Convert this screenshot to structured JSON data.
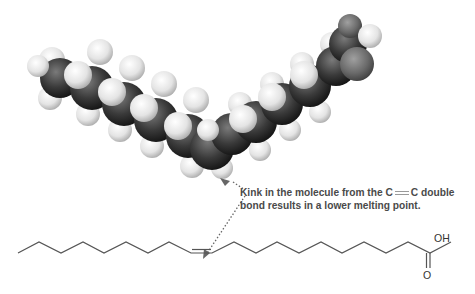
{
  "figure": {
    "type": "fatty acid molecule diagram",
    "space_filling_model": {
      "description": "Space-filling model of an unsaturated (cis) fatty acid showing a kink",
      "atom_colors": {
        "carbon": "#3a3a3a",
        "hydrogen": "#e6e6e6",
        "oxygen": "#6e6e6e"
      }
    },
    "annotation": {
      "line1_prefix": "Kink in the molecule from the C",
      "line1_bond_symbol": "=",
      "line1_suffix": "C double",
      "line2": "bond results in a lower melting point.",
      "arrow_style": "dotted double-headed",
      "text_color": "#4a4a4a"
    },
    "skeletal_formula": {
      "description": "Skeletal structure of cis-unsaturated fatty acid (oleic acid)",
      "labels": {
        "hydroxyl": "OH",
        "carbonyl_oxygen": "O"
      },
      "line_color": "#555555"
    }
  }
}
